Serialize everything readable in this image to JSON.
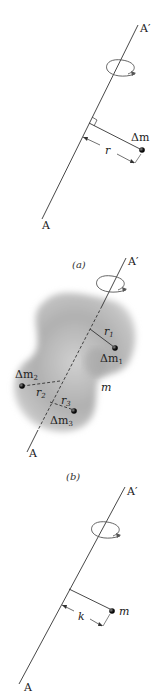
{
  "figure": {
    "panels": [
      {
        "id": "a",
        "caption": "(a)",
        "axis_top_label": "A′",
        "axis_bottom_label": "A",
        "mass_label": "Δm",
        "distance_label": "r",
        "annotations": [
          "right-angle-mark",
          "rotation-arrow"
        ]
      },
      {
        "id": "b",
        "caption": "(b)",
        "axis_top_label": "A′",
        "axis_bottom_label": "A",
        "body_label": "m",
        "masses": [
          {
            "label": "Δm",
            "sub": "1",
            "r_label": "r",
            "r_sub": "1"
          },
          {
            "label": "Δm",
            "sub": "2",
            "r_label": "r",
            "r_sub": "2"
          },
          {
            "label": "Δm",
            "sub": "3",
            "r_label": "r",
            "r_sub": "3"
          }
        ]
      },
      {
        "id": "c",
        "caption": "",
        "axis_top_label": "A′",
        "axis_bottom_label": "A",
        "mass_label": "m",
        "distance_label": "k"
      }
    ],
    "colors": {
      "line": "#333333",
      "blob": "#b5b5b5",
      "blob_dark": "#8f8f8f",
      "dot": "#111111"
    }
  }
}
